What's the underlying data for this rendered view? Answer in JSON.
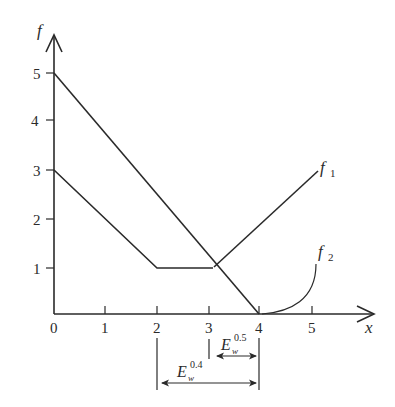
{
  "diagram": {
    "axes": {
      "y_label": "f",
      "x_label": "x",
      "x_ticks": [
        "0",
        "1",
        "2",
        "3",
        "4",
        "5"
      ],
      "y_ticks": [
        "1",
        "2",
        "3",
        "4",
        "5"
      ]
    },
    "curves": [
      {
        "name": "f1",
        "label_main": "f",
        "label_sub": "1",
        "points": [
          [
            0,
            5
          ],
          [
            4,
            0
          ]
        ],
        "second_segment": [
          [
            3.1,
            1
          ],
          [
            5.3,
            3.7
          ]
        ]
      },
      {
        "name": "f2",
        "label_main": "f",
        "label_sub": "2",
        "points": [
          [
            0,
            3
          ],
          [
            2,
            1
          ],
          [
            3.1,
            1
          ]
        ]
      }
    ],
    "annotations": [
      {
        "name": "E_w^0.5",
        "main": "E",
        "sub": "w",
        "sup": "0.5",
        "from_x": 3,
        "to_x": 4
      },
      {
        "name": "E_w^0.4",
        "main": "E",
        "sub": "w",
        "sup": "0.4",
        "from_x": 2,
        "to_x": 4
      }
    ]
  }
}
